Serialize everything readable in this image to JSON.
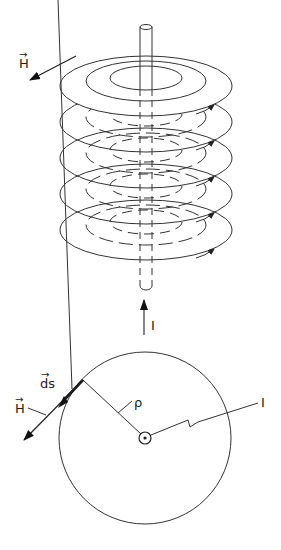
{
  "figure": {
    "top_panel": {
      "description": "Concentric circular magnetic field lines around a straight current-carrying wire (3D view)",
      "field_label": "H",
      "field_label_vector": true,
      "current_label": "I",
      "layers": 5,
      "rings_per_layer": 3
    },
    "bottom_panel": {
      "description": "Top view: circular path of radius rho around wire with current out of page",
      "field_label": "H",
      "ds_label": "ds",
      "radius_label": "ρ",
      "current_label": "I"
    },
    "colors": {
      "line": "#333333",
      "background": "#ffffff"
    }
  }
}
